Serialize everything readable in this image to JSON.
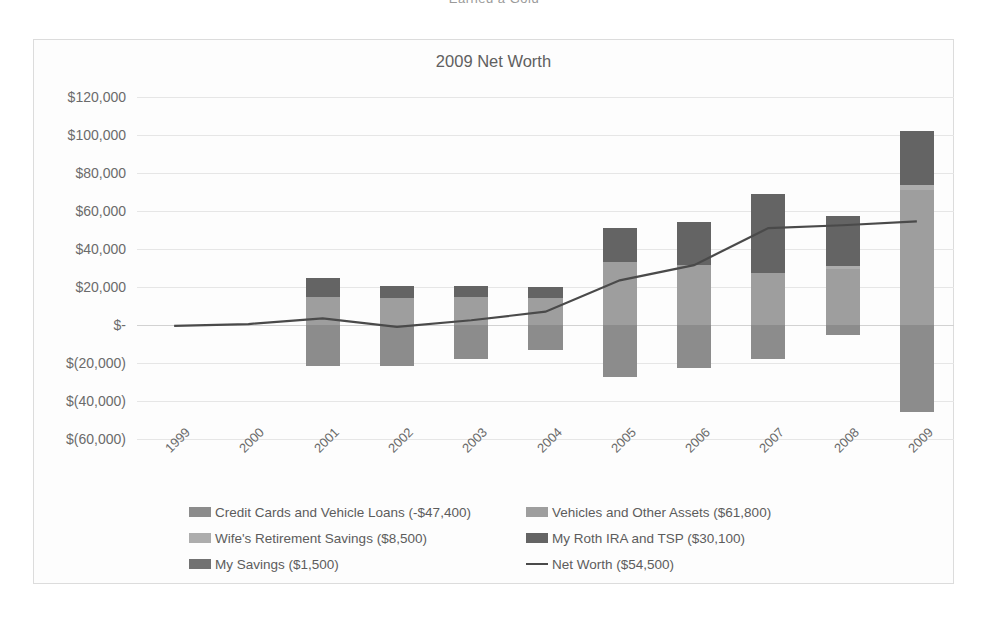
{
  "page": {
    "clipped_header": "Earned a Gold"
  },
  "chart": {
    "title": "2009 Net Worth",
    "frame_border_color": "#dcdcdc",
    "background_color": "#fdfdfd"
  },
  "chart_data": {
    "type": "bar",
    "title": "2009 Net Worth",
    "xlabel": "",
    "ylabel": "",
    "ylim": [
      -60000,
      120000
    ],
    "ytick_values": [
      120000,
      100000,
      80000,
      60000,
      40000,
      20000,
      0,
      -20000,
      -40000,
      -60000
    ],
    "ytick_labels": [
      "$120,000",
      "$100,000",
      "$80,000",
      "$60,000",
      "$40,000",
      "$20,000",
      "$-",
      "$(20,000)",
      "$(40,000)",
      "$(60,000)"
    ],
    "categories": [
      "1999",
      "2000",
      "2001",
      "2002",
      "2003",
      "2004",
      "2005",
      "2006",
      "2007",
      "2008",
      "2009"
    ],
    "grid": true,
    "stacked": true,
    "legend_position": "bottom",
    "series": [
      {
        "name": "Credit Cards and Vehicle Loans (-$47,400)",
        "short_name": "Credit Cards and Vehicle Loans",
        "total": -47400,
        "color": "#8c8c8c",
        "values": [
          0,
          0,
          -21500,
          -21500,
          -18000,
          -13000,
          -27500,
          -22500,
          -18000,
          -5000,
          -46000
        ]
      },
      {
        "name": "Vehicles and Other Assets ($61,800)",
        "short_name": "Vehicles and Other Assets",
        "total": 61800,
        "color": "#9e9e9e",
        "values": [
          0,
          0,
          15000,
          14000,
          14500,
          14000,
          33000,
          31500,
          27500,
          29500,
          71000
        ]
      },
      {
        "name": "Wife's Retirement Savings ($8,500)",
        "short_name": "Wife's Retirement Savings",
        "total": 8500,
        "color": "#adadad",
        "values": [
          0,
          0,
          0,
          0,
          0,
          0,
          0,
          0,
          0,
          1500,
          2500
        ]
      },
      {
        "name": "My Roth IRA and TSP ($30,100)",
        "short_name": "My Roth IRA and TSP",
        "total": 30100,
        "color": "#646464",
        "values": [
          0,
          0,
          10000,
          6500,
          6000,
          6000,
          18000,
          22500,
          41500,
          26500,
          28500
        ]
      },
      {
        "name": "My Savings ($1,500)",
        "short_name": "My Savings",
        "total": 1500,
        "color": "#727272",
        "values": [
          0,
          0,
          0,
          0,
          0,
          0,
          0,
          0,
          0,
          0,
          0
        ]
      }
    ],
    "line_series": {
      "name": "Net Worth ($54,500)",
      "short_name": "Net Worth",
      "total": 54500,
      "color": "#4a4a4a",
      "values": [
        -500,
        500,
        3500,
        -1000,
        2500,
        7000,
        23500,
        31500,
        51000,
        52500,
        54500
      ]
    }
  },
  "legend": {
    "rows": [
      {
        "left": {
          "label": "Credit Cards and Vehicle Loans (-$47,400)",
          "swatch": "#8c8c8c",
          "kind": "box"
        },
        "right": {
          "label": "Vehicles and Other Assets ($61,800)",
          "swatch": "#9e9e9e",
          "kind": "box"
        }
      },
      {
        "left": {
          "label": "Wife's Retirement Savings ($8,500)",
          "swatch": "#adadad",
          "kind": "box"
        },
        "right": {
          "label": "My Roth IRA and TSP ($30,100)",
          "swatch": "#646464",
          "kind": "box"
        }
      },
      {
        "left": {
          "label": "My Savings ($1,500)",
          "swatch": "#727272",
          "kind": "box"
        },
        "right": {
          "label": "Net Worth ($54,500)",
          "swatch": "#4a4a4a",
          "kind": "line"
        }
      }
    ]
  }
}
